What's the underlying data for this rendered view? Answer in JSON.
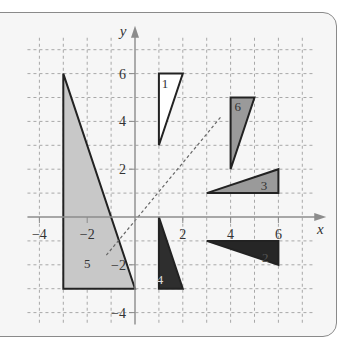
{
  "figure": {
    "type": "coordinate-plane-transformations",
    "axes": {
      "x_label": "x",
      "y_label": "y",
      "x_ticks": [
        {
          "value": -4,
          "label": "-4"
        },
        {
          "value": -2,
          "label": "-2"
        },
        {
          "value": 2,
          "label": "2"
        },
        {
          "value": 4,
          "label": "4"
        },
        {
          "value": 6,
          "label": "6"
        }
      ],
      "y_ticks": [
        {
          "value": 6,
          "label": "6"
        },
        {
          "value": 4,
          "label": "4"
        },
        {
          "value": 2,
          "label": "2"
        },
        {
          "value": -2,
          "label": "-2"
        },
        {
          "value": -4,
          "label": "-4"
        }
      ],
      "x_range": [
        -4.5,
        7.5
      ],
      "y_range": [
        -4.5,
        7.5
      ],
      "grid": "dashed"
    },
    "original_triangle": {
      "vertices": [
        [
          -3,
          6
        ],
        [
          -3,
          -3
        ],
        [
          0,
          -3
        ]
      ],
      "fill": "#c8c8c8"
    },
    "triangles": [
      {
        "label": "1",
        "vertices": [
          [
            1,
            6
          ],
          [
            2,
            6
          ],
          [
            1,
            3
          ]
        ],
        "fill": "#ffffff",
        "label_pos": [
          1.25,
          5.4
        ],
        "label_color": "#333333"
      },
      {
        "label": "6",
        "vertices": [
          [
            4,
            5
          ],
          [
            5,
            5
          ],
          [
            4,
            2
          ]
        ],
        "fill": "#9a9a9a",
        "label_pos": [
          4.3,
          4.45
        ],
        "label_color": "#333333"
      },
      {
        "label": "3",
        "vertices": [
          [
            3,
            1
          ],
          [
            6,
            1
          ],
          [
            6,
            2
          ]
        ],
        "fill": "#9a9a9a",
        "label_pos": [
          5.4,
          1.15
        ],
        "label_color": "#333333"
      },
      {
        "label": "2",
        "vertices": [
          [
            3,
            -1
          ],
          [
            6,
            -1
          ],
          [
            6,
            -2
          ]
        ],
        "fill": "#262626",
        "label_pos": [
          5.45,
          -1.9
        ],
        "label_color": "#555555"
      },
      {
        "label": "4",
        "vertices": [
          [
            1,
            0
          ],
          [
            1,
            -3
          ],
          [
            2,
            -3
          ]
        ],
        "fill": "#2e2e2e",
        "label_pos": [
          1.05,
          -2.8
        ],
        "label_color": "#dddddd"
      }
    ],
    "reflection_line": {
      "label": "5",
      "from": [
        -1.2,
        -1.6
      ],
      "to": [
        3.6,
        4.2
      ],
      "label_pos": [
        -2.0,
        -2.15
      ]
    }
  }
}
